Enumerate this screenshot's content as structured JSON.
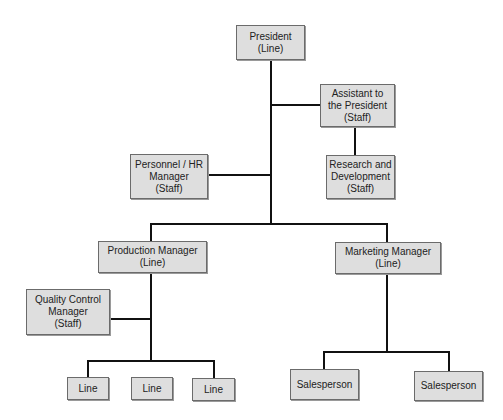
{
  "diagram": {
    "type": "organization-chart",
    "colors": {
      "box_fill": "#dedede",
      "box_border": "#6b6b6b",
      "connector": "#111111",
      "background": "#ffffff"
    },
    "nodes": {
      "president": {
        "title": "President",
        "role": "(Line)"
      },
      "assistant": {
        "title1": "Assistant to",
        "title2": "the President",
        "role": "(Staff)"
      },
      "research": {
        "title1": "Research and",
        "title2": "Development",
        "role": "(Staff)"
      },
      "personnel": {
        "title1": "Personnel / HR",
        "title2": "Manager",
        "role": "(Staff)"
      },
      "production": {
        "title": "Production Manager",
        "role": "(Line)"
      },
      "marketing": {
        "title": "Marketing Manager",
        "role": "(Line)"
      },
      "quality": {
        "title1": "Quality Control",
        "title2": "Manager",
        "role": "(Staff)"
      },
      "line1": {
        "title": "Line"
      },
      "line2": {
        "title": "Line"
      },
      "line3": {
        "title": "Line"
      },
      "sales1": {
        "title": "Salesperson"
      },
      "sales2": {
        "title": "Salesperson"
      }
    },
    "edges": [
      [
        "president",
        "assistant"
      ],
      [
        "assistant",
        "research"
      ],
      [
        "president",
        "personnel"
      ],
      [
        "president",
        "production"
      ],
      [
        "president",
        "marketing"
      ],
      [
        "production",
        "quality"
      ],
      [
        "production",
        "line1"
      ],
      [
        "production",
        "line2"
      ],
      [
        "production",
        "line3"
      ],
      [
        "marketing",
        "sales1"
      ],
      [
        "marketing",
        "sales2"
      ]
    ]
  }
}
